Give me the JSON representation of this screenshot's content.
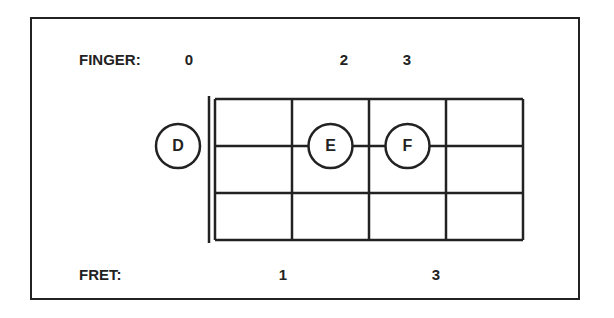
{
  "finger": {
    "label": "FINGER:",
    "values": [
      {
        "string_pos": 0,
        "text": "0"
      },
      {
        "string_pos": 2,
        "text": "2"
      },
      {
        "string_pos": 3,
        "text": "3"
      }
    ]
  },
  "fret": {
    "label": "FRET:",
    "values": [
      {
        "fret": 1,
        "text": "1"
      },
      {
        "fret": 3,
        "text": "3"
      }
    ]
  },
  "fretboard": {
    "frets": 4,
    "strings": 4,
    "notes": [
      {
        "name": "D",
        "fret": 0,
        "string": 2
      },
      {
        "name": "E",
        "fret": 2,
        "string": 2
      },
      {
        "name": "F",
        "fret": 3,
        "string": 2
      }
    ]
  },
  "colors": {
    "ink": "#222222",
    "background": "#ffffff"
  }
}
